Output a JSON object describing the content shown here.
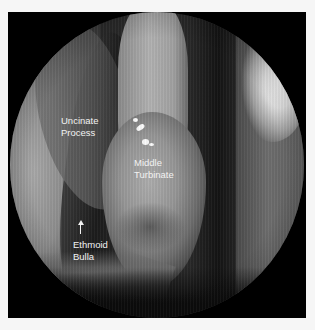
{
  "image": {
    "type": "nasal-endoscopy",
    "view": "circular endoscopic field"
  },
  "labels": {
    "uncinate": {
      "line1": "Uncinate",
      "line2": "Process"
    },
    "turbinate": {
      "line1": "Middle",
      "line2": "Turbinate"
    },
    "bulla": {
      "line1": "Ethmoid",
      "line2": "Bulla"
    }
  },
  "annotations": {
    "bulla_arrow": "up-arrow"
  },
  "colors": {
    "frame": "#000000",
    "background": "#f6f6f6",
    "label_text": "#f2f2f2"
  }
}
